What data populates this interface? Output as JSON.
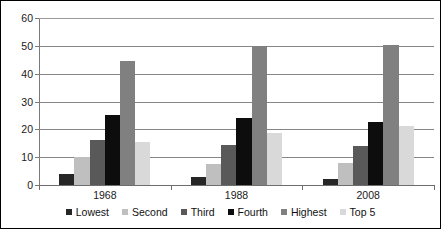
{
  "chart_data": {
    "type": "bar",
    "title": "",
    "subtitle": "",
    "xlabel": "",
    "ylabel": "",
    "categories": [
      "1968",
      "1988",
      "2008"
    ],
    "ylim": [
      0,
      60
    ],
    "yticks": [
      0,
      10,
      20,
      30,
      40,
      50,
      60
    ],
    "ytick_labels": [
      "0",
      "10",
      "20",
      "30",
      "40",
      "50",
      "60"
    ],
    "grid": true,
    "legend_position": "bottom",
    "series": [
      {
        "name": "Lowest",
        "color": "#262626",
        "values": [
          4.0,
          3.0,
          2.3
        ]
      },
      {
        "name": "Second",
        "color": "#bfbfbf",
        "values": [
          10.0,
          7.4,
          7.8
        ]
      },
      {
        "name": "Third",
        "color": "#595959",
        "values": [
          16.1,
          14.2,
          14.0
        ]
      },
      {
        "name": "Fourth",
        "color": "#0d0d0d",
        "values": [
          25.0,
          24.0,
          22.7
        ]
      },
      {
        "name": "Highest",
        "color": "#808080",
        "values": [
          44.5,
          49.9,
          50.3
        ]
      },
      {
        "name": "Top 5",
        "color": "#d9d9d9",
        "values": [
          15.6,
          18.6,
          21.2
        ]
      }
    ]
  },
  "axes": {
    "y_tick_0": "0",
    "y_tick_1": "10",
    "y_tick_2": "20",
    "y_tick_3": "30",
    "y_tick_4": "40",
    "y_tick_5": "50",
    "y_tick_6": "60",
    "x_tick_0": "1968",
    "x_tick_1": "1988",
    "x_tick_2": "2008"
  },
  "legend": {
    "items": [
      {
        "label": "Lowest"
      },
      {
        "label": "Second"
      },
      {
        "label": "Third"
      },
      {
        "label": "Fourth"
      },
      {
        "label": "Highest"
      },
      {
        "label": "Top 5"
      }
    ]
  }
}
